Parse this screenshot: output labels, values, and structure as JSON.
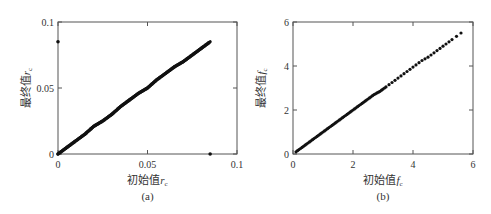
{
  "chart_data": [
    {
      "id": "a",
      "type": "scatter",
      "caption": "(a)",
      "title": "",
      "xlabel": "初始值r_c",
      "ylabel": "最终值r_c",
      "xlabel_main": "初始值",
      "xlabel_symbol": "r",
      "xlabel_sub": "c",
      "ylabel_main": "最终值",
      "ylabel_symbol": "r",
      "ylabel_sub": "c",
      "xlim": [
        0,
        0.1
      ],
      "ylim": [
        0,
        0.1
      ],
      "xticks": [
        0,
        0.05,
        0.1
      ],
      "yticks": [
        0,
        0.05,
        0.1
      ],
      "xtick_labels": [
        "0",
        "0.05",
        "0.1"
      ],
      "ytick_labels": [
        "0",
        "0.05",
        "0.1"
      ],
      "grid": false,
      "legend": null,
      "series": [
        {
          "name": "dense diagonal (final ≈ initial)",
          "x": [
            0.0,
            0.005,
            0.01,
            0.015,
            0.02,
            0.025,
            0.03,
            0.035,
            0.04,
            0.045,
            0.05,
            0.055,
            0.06,
            0.065,
            0.07,
            0.075,
            0.08,
            0.085
          ],
          "y": [
            0.0,
            0.005,
            0.01,
            0.015,
            0.021,
            0.025,
            0.03,
            0.036,
            0.041,
            0.046,
            0.05,
            0.056,
            0.061,
            0.066,
            0.07,
            0.075,
            0.08,
            0.085
          ]
        },
        {
          "name": "outliers",
          "x": [
            0.0,
            0.085
          ],
          "y": [
            0.085,
            0.0
          ]
        }
      ]
    },
    {
      "id": "b",
      "type": "scatter",
      "caption": "(b)",
      "title": "",
      "xlabel": "初始值f_c",
      "ylabel": "最终值f_c",
      "xlabel_main": "初始值",
      "xlabel_symbol": "f",
      "xlabel_sub": "c",
      "ylabel_main": "最终值",
      "ylabel_symbol": "f",
      "ylabel_sub": "c",
      "xlim": [
        0,
        6
      ],
      "ylim": [
        0,
        6
      ],
      "xticks": [
        0,
        2,
        4,
        6
      ],
      "yticks": [
        0,
        2,
        4,
        6
      ],
      "xtick_labels": [
        "0",
        "2",
        "4",
        "6"
      ],
      "ytick_labels": [
        "0",
        "2",
        "4",
        "6"
      ],
      "grid": false,
      "legend": null,
      "series": [
        {
          "name": "final vs initial",
          "x": [
            0.1,
            0.3,
            0.5,
            0.7,
            0.9,
            1.1,
            1.3,
            1.5,
            1.7,
            1.9,
            2.1,
            2.3,
            2.5,
            2.7,
            2.9,
            3.1,
            3.3,
            3.5,
            3.7,
            3.9,
            4.1,
            4.3,
            4.5,
            4.7,
            4.9,
            5.1,
            5.3,
            5.6
          ],
          "y": [
            0.1,
            0.3,
            0.5,
            0.7,
            0.9,
            1.1,
            1.3,
            1.5,
            1.7,
            1.9,
            2.1,
            2.3,
            2.5,
            2.7,
            2.85,
            3.05,
            3.25,
            3.45,
            3.65,
            3.85,
            4.05,
            4.25,
            4.4,
            4.6,
            4.8,
            5.0,
            5.2,
            5.5
          ]
        }
      ]
    }
  ]
}
